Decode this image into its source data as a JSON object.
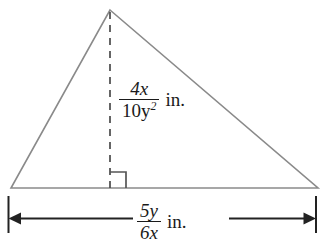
{
  "figure": {
    "type": "geometry-diagram",
    "shape": "triangle",
    "background_color": "#ffffff",
    "outline_color": "#8a8a8a",
    "dimension_line_color": "#222222",
    "text_color": "#1a1a1a",
    "height_label": {
      "numerator": "4x",
      "denominator": "10y",
      "denominator_exponent": "2",
      "unit": "in.",
      "full_text": "4x/10y² in."
    },
    "base_label": {
      "numerator": "5y",
      "denominator": "6x",
      "unit": "in.",
      "full_text": "5y/6x in."
    },
    "marks": {
      "right_angle": "right-angle-square",
      "height_line_style": "dashed",
      "base_dimension_arrows": "double-headed"
    }
  }
}
